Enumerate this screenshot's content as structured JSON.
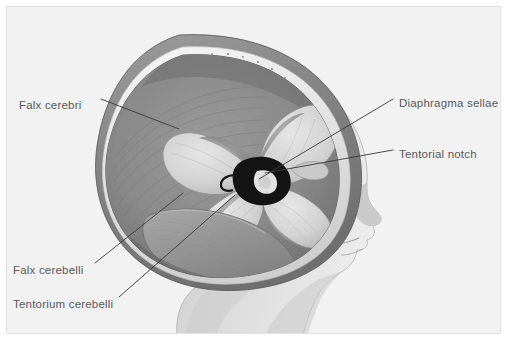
{
  "figure": {
    "type": "anatomical-illustration",
    "background_color": "#ffffff",
    "panel_color": "#f2f2f2",
    "panel_border_color": "#e3e3e3",
    "label_color": "#5a5a5a",
    "leader_line_color": "#3a3a3a"
  },
  "labels": {
    "falx_cerebri": "Falx cerebri",
    "diaphragma_sellae": "Diaphragma sellae",
    "tentorial_notch": "Tentorial notch",
    "falx_cerebelli": "Falx cerebelli",
    "tentorium_cerebelli": "Tentorium cerebelli"
  },
  "leaders": [
    {
      "name": "falx-cerebri-leader",
      "x1": 94,
      "y1": 92,
      "x2": 172,
      "y2": 122
    },
    {
      "name": "diaphragma-sellae-leader",
      "x1": 386,
      "y1": 92,
      "x2": 252,
      "y2": 172
    },
    {
      "name": "tentorial-notch-leader",
      "x1": 386,
      "y1": 143,
      "x2": 258,
      "y2": 166
    },
    {
      "name": "falx-cerebelli-leader",
      "x1": 88,
      "y1": 256,
      "x2": 176,
      "y2": 186
    },
    {
      "name": "tentorium-cerebelli-leader",
      "x1": 112,
      "y1": 290,
      "x2": 228,
      "y2": 188
    }
  ],
  "structures": [
    {
      "name": "scalp-outer-layer",
      "tone": "#8d8d8d"
    },
    {
      "name": "skull-bone-layer",
      "tone": "#efefef"
    },
    {
      "name": "dura-inner-layer",
      "tone": "#7b7b7b"
    },
    {
      "name": "falx-cerebri-sheet",
      "tone": "#8a8a8a"
    },
    {
      "name": "tentorium-leaflets",
      "tone": "#d5d5d5"
    },
    {
      "name": "tentorial-notch-opening",
      "tone": "#141414"
    },
    {
      "name": "falx-cerebelli-sheet",
      "tone": "#9a9a9a"
    },
    {
      "name": "face-profile",
      "tone": "#d8d8d8"
    }
  ]
}
